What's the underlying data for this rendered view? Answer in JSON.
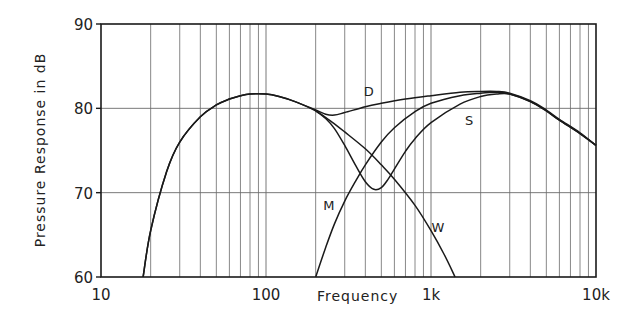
{
  "chart_data": {
    "type": "line",
    "title": "",
    "xlabel": "Frequency",
    "ylabel": "Pressure Response in dB",
    "xscale": "log",
    "xlim": [
      10,
      10000
    ],
    "ylim": [
      60,
      90
    ],
    "grid": true,
    "legend": "none (inline curve labels)",
    "x_tick_labels": [
      "10",
      "100",
      "1k",
      "10k"
    ],
    "y_tick_labels": [
      "60",
      "70",
      "80",
      "90"
    ],
    "series": [
      {
        "name": "W",
        "x": [
          18,
          20,
          25,
          30,
          40,
          50,
          60,
          70,
          80,
          100,
          120,
          150,
          200,
          250,
          300,
          400,
          500,
          600,
          800,
          1000,
          1200,
          1400
        ],
        "y": [
          60,
          65.5,
          72.5,
          76.0,
          79.0,
          80.4,
          81.1,
          81.5,
          81.7,
          81.7,
          81.4,
          80.8,
          79.7,
          78.4,
          77.2,
          75.2,
          73.3,
          71.6,
          68.5,
          65.5,
          62.7,
          60
        ]
      },
      {
        "name": "M",
        "x": [
          200,
          230,
          260,
          300,
          350,
          400,
          500,
          600,
          800,
          1000,
          1500,
          2000,
          2500,
          3000,
          4000,
          5000,
          6000,
          8000,
          10000
        ],
        "y": [
          60,
          63.5,
          66.3,
          69.0,
          71.4,
          73.3,
          76.0,
          77.7,
          79.6,
          80.6,
          81.5,
          81.8,
          81.9,
          81.7,
          80.8,
          79.7,
          78.6,
          77.0,
          75.6
        ]
      },
      {
        "name": "S",
        "x": [
          200,
          230,
          260,
          300,
          350,
          400,
          450,
          500,
          550,
          600,
          700,
          800,
          1000,
          1500,
          2000,
          2500,
          3000,
          4000,
          5000,
          6000,
          8000,
          10000
        ],
        "y": [
          79.7,
          78.8,
          77.6,
          75.6,
          73.2,
          71.3,
          70.4,
          70.6,
          71.6,
          72.8,
          74.9,
          76.4,
          78.3,
          80.5,
          81.4,
          81.7,
          81.7,
          80.8,
          79.7,
          78.6,
          77.0,
          75.6
        ]
      },
      {
        "name": "D",
        "x": [
          18,
          20,
          25,
          30,
          40,
          50,
          60,
          70,
          80,
          100,
          120,
          150,
          200,
          230,
          260,
          300,
          400,
          500,
          700,
          1000,
          1500,
          2000,
          2500,
          3000,
          4000,
          5000,
          6000,
          8000,
          10000
        ],
        "y": [
          60,
          65.5,
          72.5,
          76.0,
          79.0,
          80.4,
          81.1,
          81.5,
          81.7,
          81.7,
          81.4,
          80.8,
          79.8,
          79.3,
          79.2,
          79.5,
          80.2,
          80.6,
          81.1,
          81.5,
          81.9,
          82.0,
          82.0,
          81.8,
          80.9,
          79.8,
          78.7,
          77.1,
          75.6
        ]
      }
    ],
    "annotations": [
      {
        "text": "D",
        "x": 420,
        "y": 81.5
      },
      {
        "text": "S",
        "x": 1700,
        "y": 78.0
      },
      {
        "text": "M",
        "x": 240,
        "y": 68.0
      },
      {
        "text": "W",
        "x": 1100,
        "y": 65.3
      }
    ]
  },
  "axes": {
    "xlabel": "Frequency",
    "ylabel": "Pressure Response in dB",
    "x_ticks": [
      {
        "label": "10",
        "value": 10
      },
      {
        "label": "100",
        "value": 100
      },
      {
        "label": "1k",
        "value": 1000
      },
      {
        "label": "10k",
        "value": 10000
      }
    ],
    "y_ticks": [
      {
        "label": "60",
        "value": 60
      },
      {
        "label": "70",
        "value": 70
      },
      {
        "label": "80",
        "value": 80
      },
      {
        "label": "90",
        "value": 90
      }
    ]
  },
  "colors": {
    "line": "#1a1a1a",
    "grid": "#6a6a6a",
    "frame": "#1a1a1a",
    "background": "#ffffff"
  }
}
